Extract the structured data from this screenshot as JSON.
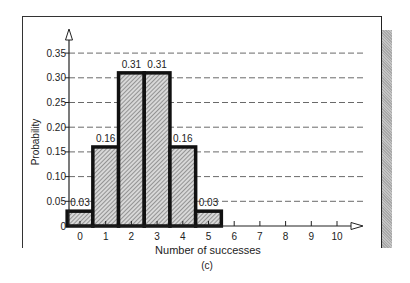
{
  "chart_data": {
    "type": "bar",
    "title": "",
    "caption": "(c)",
    "xlabel": "Number of successes",
    "ylabel": "Probability",
    "categories": [
      "0",
      "1",
      "2",
      "3",
      "4",
      "5",
      "6",
      "7",
      "8",
      "9",
      "10"
    ],
    "values": [
      0.03,
      0.16,
      0.31,
      0.31,
      0.16,
      0.03,
      0,
      0,
      0,
      0,
      0
    ],
    "bar_labels": [
      "0.03",
      "0.16",
      "0.31",
      "0.31",
      "0.16",
      "0.03",
      "",
      "",
      "",
      "",
      ""
    ],
    "yticks": [
      "0",
      "0.05",
      "0.10",
      "0.15",
      "0.20",
      "0.25",
      "0.30",
      "0.35"
    ],
    "ytick_values": [
      0,
      0.05,
      0.1,
      0.15,
      0.2,
      0.25,
      0.3,
      0.35
    ],
    "xticks": [
      "0",
      "1",
      "2",
      "3",
      "4",
      "5",
      "6",
      "7",
      "8",
      "9",
      "10"
    ],
    "ylim": [
      0,
      0.37
    ],
    "xlim": [
      -0.5,
      11
    ],
    "grid": "horizontal dashed",
    "legend": null,
    "bar_style": "hatched, thick black outline, histogram (adjacent bars)"
  },
  "colors": {
    "outline": "#111111",
    "hatch": "#555555",
    "hatch_bg": "#d6d6d6",
    "grid": "#444444",
    "shadow": "#b5b5b5"
  }
}
